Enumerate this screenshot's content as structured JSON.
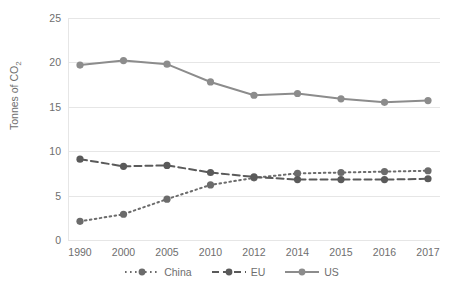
{
  "chart_data": {
    "type": "line",
    "title": "",
    "xlabel": "",
    "ylabel": "Tonnes of CO",
    "ylabel_sub": "2",
    "categories": [
      "1990",
      "2000",
      "2005",
      "2010",
      "2012",
      "2014",
      "2015",
      "2016",
      "2017"
    ],
    "yticks": [
      "0",
      "5",
      "10",
      "15",
      "20",
      "25"
    ],
    "ylim": [
      0,
      25
    ],
    "grid": true,
    "legend_position": "bottom",
    "series": [
      {
        "name": "China",
        "style": "dotted",
        "color": "#6b6b6b",
        "values": [
          2.1,
          2.9,
          4.6,
          6.2,
          7.0,
          7.5,
          7.6,
          7.7,
          7.8
        ]
      },
      {
        "name": "EU",
        "style": "dashed",
        "color": "#5a5a5a",
        "values": [
          9.1,
          8.3,
          8.4,
          7.6,
          7.1,
          6.8,
          6.8,
          6.8,
          6.9
        ]
      },
      {
        "name": "US",
        "style": "solid",
        "color": "#8c8c8c",
        "values": [
          19.7,
          20.2,
          19.8,
          17.8,
          16.3,
          16.5,
          15.9,
          15.5,
          15.7
        ]
      }
    ]
  },
  "legend": {
    "items": [
      {
        "label": "China"
      },
      {
        "label": "EU"
      },
      {
        "label": "US"
      }
    ]
  }
}
